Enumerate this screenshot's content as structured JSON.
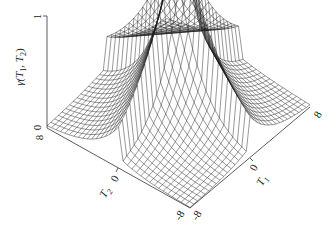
{
  "chart_data": {
    "type": "surface3d",
    "title": "",
    "zlabel": "γ(T1, T2)",
    "xlabel": "T1",
    "ylabel": "T2",
    "x_ticks": [
      "-8",
      "0",
      "8"
    ],
    "y_ticks": [
      "-8",
      "0",
      "8"
    ],
    "z_ticks": [
      "0",
      "1"
    ],
    "x_range": [
      -8,
      8
    ],
    "y_range": [
      -8,
      8
    ],
    "z_range": [
      0,
      1
    ],
    "grid_resolution": 33,
    "function_description": "Wireframe surface with sharp cusp peak of 1 at T1=T2=0, decaying along both axes; ridges along T1=0 and T2=0 with near-zero values at far corners",
    "sample_values": [
      {
        "T1": 0,
        "T2": 0,
        "gamma": 1.0
      },
      {
        "T1": 8,
        "T2": 0,
        "gamma": 0.45
      },
      {
        "T1": 0,
        "T2": 8,
        "gamma": 0.45
      },
      {
        "T1": 8,
        "T2": 8,
        "gamma": 0.0
      },
      {
        "T1": -8,
        "T2": -8,
        "gamma": 0.0
      }
    ],
    "style": {
      "mesh_color": "#1a1a1a",
      "background": "#ffffff"
    }
  },
  "labels": {
    "z_axis_title": "γ(T",
    "z_sub1": "1",
    "z_mid": ", T",
    "z_sub2": "2",
    "z_end": ")",
    "z_tick_top": "1",
    "z_tick_bottom": "0",
    "corner_left_tick": "8",
    "t2_zero": "0",
    "t2_name": "T",
    "t2_sub": "2",
    "t1_zero": "0",
    "t1_name": "T",
    "t1_sub": "1",
    "bottom_tick_a": "-8",
    "bottom_tick_b": "-8",
    "right_tick": "8"
  }
}
